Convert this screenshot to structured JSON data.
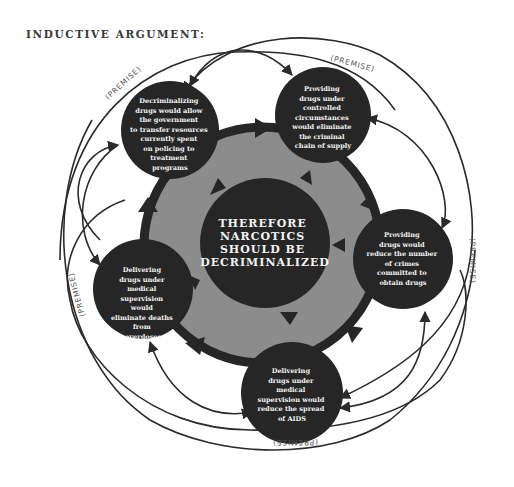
{
  "title": "INDUCTIVE ARGUMENT:",
  "colors": {
    "ring_fill": "#8c8c8c",
    "ring_border": "#262626",
    "node_fill": "#262626",
    "node_text": "#f2f2f2",
    "arc_stroke": "#2b2b2b"
  },
  "conclusion": {
    "lines": [
      "THEREFORE",
      "NARCOTICS",
      "SHOULD BE",
      "DECRIMINALIZED"
    ]
  },
  "premise_label": "(PREMISE)",
  "premises": [
    {
      "id": "transfer-resources",
      "lines": [
        "Decriminalizing",
        "drugs would allow",
        "the government",
        "to transfer resources",
        "currently spent",
        "on policing to",
        "treatment",
        "programs"
      ]
    },
    {
      "id": "eliminate-supply-chain",
      "lines": [
        "Providing",
        "drugs under",
        "controlled",
        "circumstances",
        "would eliminate",
        "the criminal",
        "chain of supply"
      ]
    },
    {
      "id": "reduce-crimes",
      "lines": [
        "Providing",
        "drugs would",
        "reduce the number",
        "of crimes",
        "committed to",
        "obtain drugs"
      ]
    },
    {
      "id": "reduce-aids",
      "lines": [
        "Delivering",
        "drugs under",
        "medical",
        "supervision would",
        "reduce the spread",
        "of AIDS"
      ]
    },
    {
      "id": "eliminate-overdoses",
      "lines": [
        "Delivering",
        "drugs under",
        "medical",
        "supervision",
        "would",
        "eliminate deaths",
        "from",
        "overdoses"
      ]
    }
  ]
}
